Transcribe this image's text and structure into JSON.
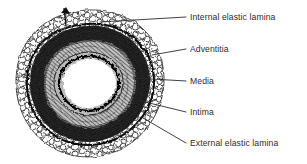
{
  "figure": {
    "background_color": "#ffffff",
    "ink_color": "#2b2b2b",
    "lumen_color": "#ffffff"
  },
  "labels": [
    {
      "id": "internal-elastic-lamina",
      "text": "Internal elastic lamina",
      "x": 190,
      "y": 13,
      "leader": {
        "x1": 186,
        "y1": 17,
        "x2": 100,
        "y2": 22
      }
    },
    {
      "id": "adventitia",
      "text": "Adventitia",
      "x": 190,
      "y": 45,
      "leader": {
        "x1": 186,
        "y1": 49,
        "x2": 152,
        "y2": 55
      }
    },
    {
      "id": "media",
      "text": "Media",
      "x": 190,
      "y": 77,
      "leader": {
        "x1": 186,
        "y1": 81,
        "x2": 134,
        "y2": 78
      }
    },
    {
      "id": "intima",
      "text": "Intima",
      "x": 190,
      "y": 108,
      "leader": {
        "x1": 186,
        "y1": 112,
        "x2": 137,
        "y2": 100
      }
    },
    {
      "id": "external-elastic-lamina",
      "text": "External elastic lamina",
      "x": 190,
      "y": 139,
      "leader": {
        "x1": 186,
        "y1": 143,
        "x2": 143,
        "y2": 118
      }
    }
  ],
  "layers": [
    {
      "name": "adventitia",
      "description": "outer cobblestone cellular coat"
    },
    {
      "name": "external elastic lamina",
      "description": "boundary between media and adventitia"
    },
    {
      "name": "media",
      "description": "thick concentric smooth muscle / elastic fibre rings"
    },
    {
      "name": "internal elastic lamina",
      "description": "wavy crenulated inner boundary"
    },
    {
      "name": "intima",
      "description": "thin inner lining adjacent to lumen"
    },
    {
      "name": "lumen",
      "description": "central open white space"
    }
  ]
}
